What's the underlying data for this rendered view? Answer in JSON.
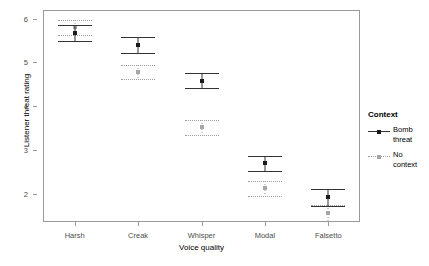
{
  "chart_data": {
    "type": "scatter",
    "title": "",
    "xlabel": "Voice quality",
    "ylabel": "Listener threat rating",
    "categories": [
      "Harsh",
      "Creak",
      "Whisper",
      "Modal",
      "Falsetto"
    ],
    "yticks": [
      2,
      3,
      4,
      5,
      6
    ],
    "ylim": [
      1.35,
      6.2
    ],
    "grid": false,
    "legend_position": "right",
    "legend_title": "Context",
    "series": [
      {
        "name": "Bomb threat",
        "style": "solid",
        "color": "#1a1a1a",
        "values": [
          5.68,
          5.4,
          4.58,
          2.69,
          1.92
        ],
        "ci_low": [
          5.49,
          5.21,
          4.41,
          2.52,
          1.72
        ],
        "ci_high": [
          5.86,
          5.58,
          4.76,
          2.86,
          2.1
        ]
      },
      {
        "name": "No context",
        "style": "dotted",
        "color": "#a6a6a6",
        "values": [
          5.8,
          4.78,
          3.52,
          2.12,
          1.55
        ],
        "ci_low": [
          5.62,
          4.62,
          3.34,
          1.94,
          1.37
        ],
        "ci_high": [
          5.98,
          4.95,
          3.69,
          2.29,
          1.73
        ]
      }
    ]
  },
  "axes": {
    "y_title": "Listener threat rating",
    "x_title": "Voice quality",
    "y_tick_labels": [
      "2",
      "3",
      "4",
      "5",
      "6"
    ],
    "x_tick_labels": [
      "Harsh",
      "Creak",
      "Whisper",
      "Modal",
      "Falsetto"
    ]
  },
  "legend": {
    "title": "Context",
    "items": [
      {
        "label_line1": "Bomb",
        "label_line2": "threat",
        "style": "solid"
      },
      {
        "label_line1": "No",
        "label_line2": "context",
        "style": "dashed"
      }
    ]
  }
}
